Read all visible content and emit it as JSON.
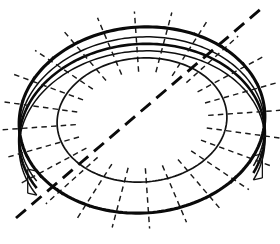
{
  "figure": {
    "background_color": "#ffffff",
    "line_color": "#0a0a0a",
    "canvas": {
      "width": 280,
      "height": 244
    }
  },
  "geometry": {
    "center": {
      "x": 142,
      "y": 120
    },
    "outer_ellipse": {
      "rx": 123,
      "ry": 93,
      "rotation_deg": -4,
      "stroke_width": 3.1
    },
    "inner_ellipse": {
      "rx": 85,
      "ry": 62,
      "rotation_deg": -4,
      "stroke_width": 1.7
    },
    "rim_band": {
      "arc_count": 3,
      "offsets_y": [
        10,
        17,
        24
      ],
      "start_angle_deg": 152,
      "end_angle_deg": 28,
      "stroke_width": 1.5
    },
    "spokes": {
      "count": 24,
      "style": "dashed",
      "dash_pattern": "5.5 4.2",
      "inner_start_fraction": 0.78,
      "outer_end_fraction": 1.17
    },
    "tick_marks": {
      "count": 24,
      "length": 9,
      "stroke_width": 1.5
    },
    "section_line": {
      "label": "section cutting plane",
      "from": {
        "x": 16,
        "y": 218
      },
      "to": {
        "x": 262,
        "y": 8
      },
      "style": "long-dashed",
      "dash_pattern": "13 7.5",
      "stroke_width": 2.9
    }
  },
  "labels": {
    "outer_edge": "outer-ellipse",
    "inner_edge": "inner-ellipse",
    "rim": "rim-band",
    "spokes": "radial-spokes",
    "section": "section-line"
  }
}
